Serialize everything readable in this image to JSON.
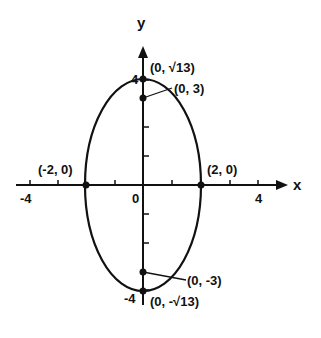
{
  "diagram": {
    "type": "ellipse-graph",
    "equation_implied": "x^2/4 + y^2/13 = 1",
    "axes": {
      "x_label": "x",
      "y_label": "y",
      "origin_label": "0",
      "x_ticks": {
        "neg": "-4",
        "pos": "4"
      },
      "y_ticks": {
        "pos": "4",
        "neg": "-4"
      }
    },
    "points": {
      "vertex_top": "(0, √13)",
      "focus_top": "(0, 3)",
      "covertex_left": "(-2, 0)",
      "covertex_right": "(2, 0)",
      "focus_bottom": "(0, -3)",
      "vertex_bottom": "(0, -√13)"
    },
    "colors": {
      "ink": "#111111",
      "background": "#ffffff"
    }
  }
}
